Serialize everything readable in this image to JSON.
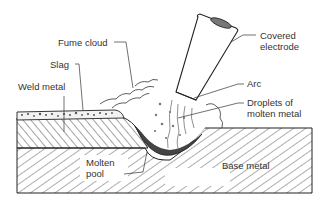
{
  "diagram": {
    "labels": {
      "covered_electrode_line1": "Covered",
      "covered_electrode_line2": "electrode",
      "fume_cloud": "Fume cloud",
      "slag": "Slag",
      "weld_metal": "Weld metal",
      "arc": "Arc",
      "droplets_line1": "Droplets of",
      "droplets_line2": "molten metal",
      "molten_pool_line1": "Molten",
      "molten_pool_line2": "pool",
      "base_metal": "Base metal"
    },
    "colors": {
      "line": "#222222",
      "text": "#333333",
      "pool": "#444444",
      "background": "#ffffff"
    }
  }
}
